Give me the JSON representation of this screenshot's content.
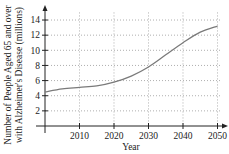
{
  "chart_data": {
    "type": "line",
    "title": "",
    "xlabel": "Year",
    "ylabel_line1": "Number of People Aged 65 and over",
    "ylabel_line2": "with Alzheimer's Disease (millions)",
    "x": [
      2000,
      2005,
      2010,
      2015,
      2020,
      2025,
      2030,
      2035,
      2040,
      2045,
      2050
    ],
    "series": [
      {
        "name": "People aged 65+ with Alzheimer's (millions)",
        "values": [
          4.5,
          4.9,
          5.1,
          5.3,
          5.8,
          6.6,
          7.8,
          9.4,
          11.0,
          12.4,
          13.2
        ]
      }
    ],
    "xlim": [
      2000,
      2052
    ],
    "ylim": [
      0,
      15
    ],
    "xticks": [
      2010,
      2020,
      2030,
      2040,
      2050
    ],
    "yticks": [
      2,
      4,
      6,
      8,
      10,
      12,
      14
    ],
    "grid": true,
    "grid_style": "dotted",
    "legend": "none",
    "colors": {
      "line": "#7a7a7a",
      "axis": "#222222",
      "grid": "#9a9a9a"
    }
  }
}
